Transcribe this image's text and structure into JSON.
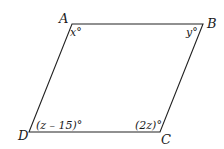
{
  "figure": {
    "type": "parallelogram",
    "vertices": [
      {
        "name": "A",
        "label": "A",
        "x": 72,
        "y": 24
      },
      {
        "name": "B",
        "label": "B",
        "x": 203,
        "y": 24
      },
      {
        "name": "C",
        "label": "C",
        "x": 160,
        "y": 132
      },
      {
        "name": "D",
        "label": "D",
        "x": 29,
        "y": 132
      }
    ],
    "angles": {
      "A": "x°",
      "B": "y°",
      "C": "(2z)°",
      "D": "(z – 15)°"
    },
    "stroke_color": "#222222"
  }
}
